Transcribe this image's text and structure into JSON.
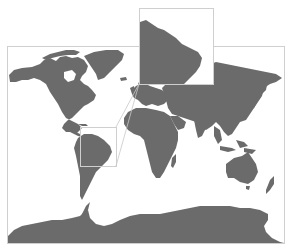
{
  "map": {
    "type": "world-map",
    "projection": "mercator-like",
    "colors": {
      "land": "#6b6b6b",
      "water": "#ffffff",
      "frame": "#cfcfcf",
      "connector": "#c8c8c8"
    },
    "main_frame": {
      "x": 7,
      "y": 46,
      "width": 277,
      "height": 197
    },
    "inset": {
      "subject": "northern South America (enlarged)",
      "box": {
        "x": 139,
        "y": 8,
        "width": 74,
        "height": 76
      },
      "source_box": {
        "x": 80,
        "y": 127,
        "width": 36,
        "height": 39
      }
    },
    "landmasses": [
      "North America",
      "Greenland",
      "South America",
      "Europe",
      "Africa",
      "Asia",
      "Australia",
      "New Zealand",
      "Antarctica"
    ]
  }
}
